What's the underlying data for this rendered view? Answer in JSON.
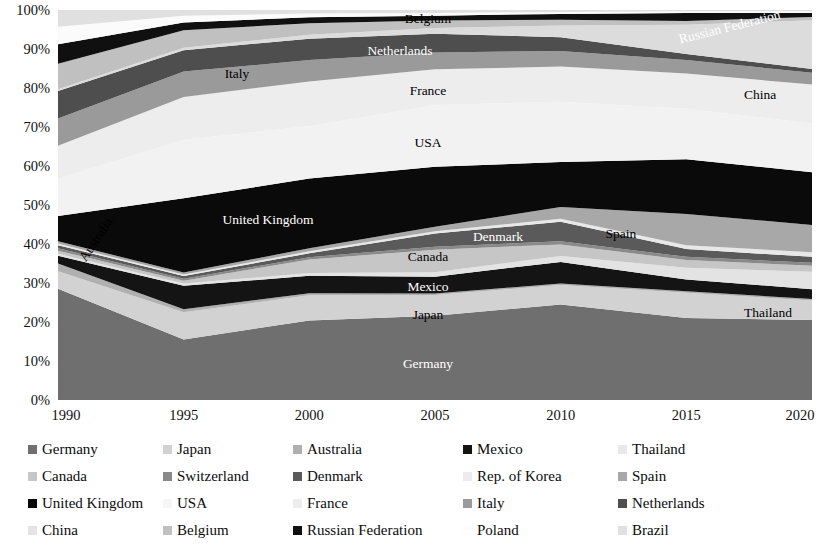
{
  "chart_data": {
    "type": "area",
    "stacked": "percent",
    "title": "",
    "xlabel": "",
    "ylabel": "",
    "grid": false,
    "legend_position": "bottom",
    "x": [
      1990,
      1995,
      2000,
      2005,
      2010,
      2015,
      2020
    ],
    "xtick_labels": [
      "1990",
      "1995",
      "2000",
      "2005",
      "2010",
      "2015",
      "2020"
    ],
    "ylim": [
      0,
      100
    ],
    "ytick_labels": [
      "0%",
      "10%",
      "20%",
      "30%",
      "40%",
      "50%",
      "60%",
      "70%",
      "80%",
      "90%",
      "100%"
    ],
    "ytick_values": [
      0,
      10,
      20,
      30,
      40,
      50,
      60,
      70,
      80,
      90,
      100
    ],
    "series": [
      {
        "name": "Germany",
        "color": "#6f6f6f",
        "label_inside": "Germany",
        "values": [
          28.5,
          15.5,
          20.5,
          22.5,
          24.5,
          21.0,
          20.5
        ]
      },
      {
        "name": "Japan",
        "color": "#d2d2d2",
        "label_inside": "Japan",
        "values": [
          4.5,
          7.0,
          6.5,
          5.5,
          5.0,
          6.5,
          5.0
        ]
      },
      {
        "name": "Australia",
        "color": "#b0b0b0",
        "label_inside": "Australia",
        "values": [
          2.0,
          0.8,
          0.5,
          0.4,
          0.4,
          0.4,
          0.4
        ]
      },
      {
        "name": "Mexico",
        "color": "#141414",
        "label_inside": "Mexico",
        "values": [
          2.0,
          6.0,
          4.5,
          4.5,
          5.5,
          3.0,
          2.5
        ]
      },
      {
        "name": "Thailand",
        "color": "#e3e3e3",
        "label_inside": "Thailand",
        "values": [
          0.5,
          0.6,
          0.7,
          1.2,
          1.5,
          3.0,
          4.5
        ]
      },
      {
        "name": "Canada",
        "color": "#c6c6c6",
        "label_inside": "Canada",
        "values": [
          0.8,
          0.7,
          3.5,
          6.0,
          3.0,
          2.0,
          1.5
        ]
      },
      {
        "name": "Switzerland",
        "color": "#8a8a8a",
        "label_inside": "",
        "values": [
          0.6,
          0.5,
          0.6,
          0.8,
          0.8,
          0.8,
          0.8
        ]
      },
      {
        "name": "Denmark",
        "color": "#5a5a5a",
        "label_inside": "Denmark",
        "values": [
          0.8,
          0.7,
          1.0,
          3.5,
          5.0,
          2.0,
          1.5
        ]
      },
      {
        "name": "Rep. of Korea",
        "color": "#e8e8e8",
        "label_inside": "",
        "values": [
          0.4,
          0.4,
          0.5,
          0.6,
          0.8,
          1.0,
          1.2
        ]
      },
      {
        "name": "Spain",
        "color": "#a8a8a8",
        "label_inside": "Spain",
        "values": [
          0.6,
          0.5,
          0.8,
          1.2,
          3.0,
          8.0,
          7.0
        ]
      },
      {
        "name": "United Kingdom",
        "color": "#0a0a0a",
        "label_inside": "United Kingdom",
        "values": [
          6.5,
          19.0,
          18.0,
          16.0,
          11.5,
          14.0,
          13.5
        ]
      },
      {
        "name": "USA",
        "color": "#f2f2f2",
        "label_inside": "USA",
        "values": [
          9.5,
          15.0,
          13.5,
          16.5,
          15.5,
          13.0,
          12.5
        ]
      },
      {
        "name": "France",
        "color": "#ededed",
        "label_inside": "France",
        "values": [
          8.5,
          11.0,
          11.5,
          9.5,
          9.0,
          9.0,
          10.0
        ]
      },
      {
        "name": "Italy",
        "color": "#9a9a9a",
        "label_inside": "Italy",
        "values": [
          7.0,
          6.5,
          5.5,
          4.5,
          4.0,
          3.5,
          3.0
        ]
      },
      {
        "name": "Netherlands",
        "color": "#4e4e4e",
        "label_inside": "Netherlands",
        "values": [
          7.0,
          5.5,
          5.5,
          5.0,
          3.5,
          1.5,
          1.0
        ]
      },
      {
        "name": "China",
        "color": "#dcdcdc",
        "label_inside": "China",
        "values": [
          0.5,
          0.6,
          1.0,
          1.5,
          3.0,
          7.5,
          12.5
        ]
      },
      {
        "name": "Belgium",
        "color": "#c0c0c0",
        "label_inside": "Belgium",
        "values": [
          6.5,
          4.5,
          3.0,
          2.0,
          1.5,
          1.0,
          0.8
        ]
      },
      {
        "name": "Russian Federation",
        "color": "#101010",
        "label_inside": "Russian Federation",
        "values": [
          5.0,
          2.0,
          1.5,
          1.3,
          1.5,
          2.0,
          1.0
        ]
      },
      {
        "name": "Poland",
        "color": "#fbfbfb",
        "label_inside": "",
        "values": [
          4.5,
          1.7,
          1.0,
          0.7,
          0.5,
          0.5,
          0.5
        ]
      },
      {
        "name": "Brazil",
        "color": "#e0e0e0",
        "label_inside": "",
        "values": [
          4.3,
          1.5,
          0.9,
          0.8,
          0.5,
          0.3,
          0.3
        ]
      }
    ],
    "inline_labels": [
      {
        "text": "Germany",
        "x": 428,
        "y": 365,
        "tone": "light",
        "rotate": 0
      },
      {
        "text": "Japan",
        "x": 428,
        "y": 316,
        "tone": "dark",
        "rotate": 0
      },
      {
        "text": "Mexico",
        "x": 428,
        "y": 288,
        "tone": "light",
        "rotate": 0
      },
      {
        "text": "Canada",
        "x": 428,
        "y": 258,
        "tone": "dark",
        "rotate": 0
      },
      {
        "text": "Thailand",
        "x": 768,
        "y": 314,
        "tone": "dark",
        "rotate": 0
      },
      {
        "text": "Denmark",
        "x": 498,
        "y": 238,
        "tone": "light",
        "rotate": 0
      },
      {
        "text": "Spain",
        "x": 621,
        "y": 235,
        "tone": "dark",
        "rotate": 0
      },
      {
        "text": "United Kingdom",
        "x": 268,
        "y": 221,
        "tone": "light",
        "rotate": 0
      },
      {
        "text": "USA",
        "x": 428,
        "y": 144,
        "tone": "dark",
        "rotate": 0
      },
      {
        "text": "France",
        "x": 428,
        "y": 92,
        "tone": "dark",
        "rotate": 0
      },
      {
        "text": "Italy",
        "x": 237,
        "y": 75,
        "tone": "dark",
        "rotate": 0
      },
      {
        "text": "Netherlands",
        "x": 400,
        "y": 52,
        "tone": "light",
        "rotate": 0
      },
      {
        "text": "Belgium",
        "x": 428,
        "y": 20,
        "tone": "dark",
        "rotate": 0
      },
      {
        "text": "China",
        "x": 760,
        "y": 96,
        "tone": "dark",
        "rotate": 0
      },
      {
        "text": "Russian Federation",
        "x": 730,
        "y": 28,
        "tone": "light",
        "rotate": -14
      },
      {
        "text": "Australia",
        "x": 97,
        "y": 240,
        "tone": "dark",
        "rotate": -56
      }
    ]
  },
  "legend": {
    "rows": [
      [
        {
          "label": "Germany",
          "color": "#6f6f6f"
        },
        {
          "label": "Japan",
          "color": "#d2d2d2"
        },
        {
          "label": "Australia",
          "color": "#b0b0b0"
        },
        {
          "label": "Mexico",
          "color": "#141414"
        },
        {
          "label": "Thailand",
          "color": "#e9e9e9"
        }
      ],
      [
        {
          "label": "Canada",
          "color": "#c6c6c6"
        },
        {
          "label": "Switzerland",
          "color": "#8a8a8a"
        },
        {
          "label": "Denmark",
          "color": "#5a5a5a"
        },
        {
          "label": "Rep. of Korea",
          "color": "#ececec"
        },
        {
          "label": "Spain",
          "color": "#a8a8a8"
        }
      ],
      [
        {
          "label": "United Kingdom",
          "color": "#0a0a0a"
        },
        {
          "label": "USA",
          "color": "#f6f6f6"
        },
        {
          "label": "France",
          "color": "#ededed"
        },
        {
          "label": "Italy",
          "color": "#9a9a9a"
        },
        {
          "label": "Netherlands",
          "color": "#4e4e4e"
        }
      ],
      [
        {
          "label": "China",
          "color": "#e4e4e4"
        },
        {
          "label": "Belgium",
          "color": "#c0c0c0"
        },
        {
          "label": "Russian Federation",
          "color": "#101010"
        },
        {
          "label": "Poland",
          "color": "#fdfdfd"
        },
        {
          "label": "Brazil",
          "color": "#e0e0e0"
        }
      ]
    ]
  }
}
